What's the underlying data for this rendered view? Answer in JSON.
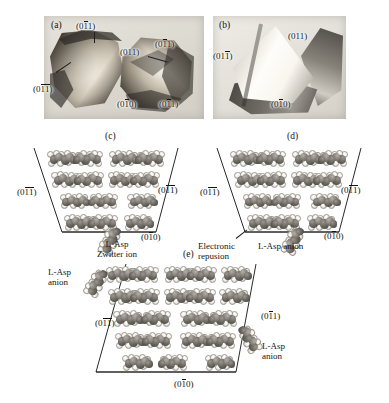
{
  "figure": {
    "type": "crystallography-figure",
    "panel_count": 5
  },
  "panels": {
    "a": {
      "id": "(a)",
      "kind": "photograph",
      "face_labels": [
        {
          "key": "top",
          "text": "(011)",
          "overbar": "middle"
        },
        {
          "key": "left",
          "text": "(011)",
          "overbar": "both"
        },
        {
          "key": "center",
          "text": "(011)",
          "overbar": "none"
        },
        {
          "key": "upper_right",
          "text": "(011)",
          "overbar": "middle"
        },
        {
          "key": "bottom_left",
          "text": "(010)",
          "overbar": "middle"
        },
        {
          "key": "bottom_right",
          "text": "(011)",
          "overbar": "middle"
        }
      ]
    },
    "b": {
      "id": "(b)",
      "kind": "photograph",
      "face_labels": [
        {
          "key": "right",
          "text": "(011)",
          "overbar": "none"
        },
        {
          "key": "left",
          "text": "(011)",
          "overbar": "last"
        },
        {
          "key": "bottom",
          "text": "(010)",
          "overbar": "middle"
        }
      ]
    },
    "c": {
      "id": "(c)",
      "kind": "packing-diagram",
      "molecule_rows": [
        4,
        4,
        3,
        3
      ],
      "face_labels": [
        {
          "key": "left",
          "text": "(011)",
          "overbar": "both"
        },
        {
          "key": "right",
          "text": "(011)",
          "overbar": "both"
        },
        {
          "key": "bottom",
          "text": "(010)",
          "overbar": "middle"
        }
      ],
      "annotations": [
        {
          "key": "species",
          "line1": "L-Asp",
          "line2": "Zwitter ion"
        }
      ]
    },
    "d": {
      "id": "(d)",
      "kind": "packing-diagram",
      "molecule_rows": [
        4,
        4,
        3,
        3
      ],
      "face_labels": [
        {
          "key": "left",
          "text": "(011)",
          "overbar": "both"
        },
        {
          "key": "right",
          "text": "(011)",
          "overbar": "both"
        },
        {
          "key": "bottom",
          "text": "(010)",
          "overbar": "middle"
        }
      ],
      "annotations": [
        {
          "key": "repulsion",
          "line1": "Electronic",
          "line2": "repusion"
        },
        {
          "key": "species",
          "line1": "L-Asp anion",
          "line2": ""
        }
      ]
    },
    "e": {
      "id": "(e)",
      "kind": "packing-diagram",
      "molecule_rows": [
        5,
        5,
        4,
        4,
        3
      ],
      "face_labels": [
        {
          "key": "left",
          "text": "(011)",
          "overbar": "both"
        },
        {
          "key": "right",
          "text": "(011)",
          "overbar": "middle"
        },
        {
          "key": "bottom",
          "text": "(010)",
          "overbar": "middle"
        }
      ],
      "annotations": [
        {
          "key": "anion_left",
          "line1": "L-Asp",
          "line2": "anion"
        },
        {
          "key": "anion_right",
          "line1": "L-Asp",
          "line2": "anion"
        }
      ]
    }
  },
  "colors": {
    "ink": "#141414",
    "outline": "#2a2a2a",
    "carbon_dark": "#5c5852",
    "carbon_mid": "#87837c",
    "hydrogen": "#f0eee9",
    "photo_bg": "#ded9d1"
  }
}
